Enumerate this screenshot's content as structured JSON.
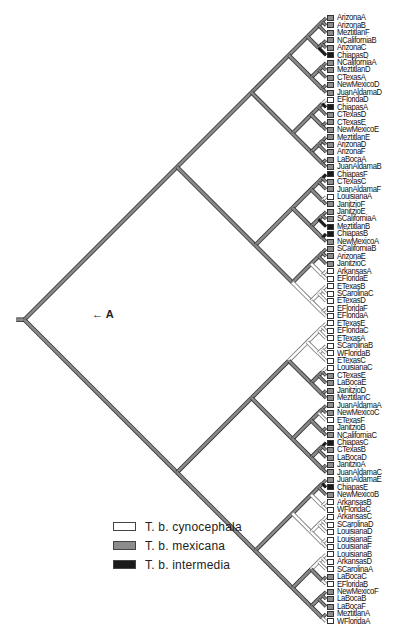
{
  "figure": {
    "annotation_label": "A",
    "annotation_arrow": "arrow-left"
  },
  "legend": [
    {
      "label": "T. b. cynocephala",
      "color": "#ffffff"
    },
    {
      "label": "T. b. mexicana",
      "color": "#8c8c8c"
    },
    {
      "label": "T. b. intermedia",
      "color": "#1a1a1a"
    }
  ],
  "colors": {
    "cynocephala": "#ffffff",
    "mexicana": "#8c8c8c",
    "intermedia": "#1a1a1a",
    "branch_stroke": "#555555"
  },
  "leaves": [
    {
      "name": "ArizonaA",
      "group": "mexicana"
    },
    {
      "name": "ArizonaB",
      "group": "mexicana"
    },
    {
      "name": "MeztitlanF",
      "group": "mexicana"
    },
    {
      "name": "NCaliforniaB",
      "group": "mexicana"
    },
    {
      "name": "ArizonaC",
      "group": "mexicana"
    },
    {
      "name": "ChiapasD",
      "group": "intermedia"
    },
    {
      "name": "NCaliforniaA",
      "group": "mexicana"
    },
    {
      "name": "MeztitlanD",
      "group": "mexicana"
    },
    {
      "name": "CTexasA",
      "group": "mexicana"
    },
    {
      "name": "NewMexicoD",
      "group": "mexicana"
    },
    {
      "name": "JuanAldamaD",
      "group": "mexicana"
    },
    {
      "name": "EFloridaD",
      "group": "cynocephala"
    },
    {
      "name": "ChiapasA",
      "group": "intermedia"
    },
    {
      "name": "CTexasD",
      "group": "mexicana"
    },
    {
      "name": "CTexasE",
      "group": "mexicana"
    },
    {
      "name": "NewMexicoE",
      "group": "mexicana"
    },
    {
      "name": "MeztitlanE",
      "group": "mexicana"
    },
    {
      "name": "ArizonaD",
      "group": "mexicana"
    },
    {
      "name": "ArizonaF",
      "group": "mexicana"
    },
    {
      "name": "LaBocaA",
      "group": "mexicana"
    },
    {
      "name": "JuanAldamaB",
      "group": "mexicana"
    },
    {
      "name": "ChiapasF",
      "group": "intermedia"
    },
    {
      "name": "CTexasC",
      "group": "mexicana"
    },
    {
      "name": "JuanAldamaF",
      "group": "mexicana"
    },
    {
      "name": "LouisianaA",
      "group": "cynocephala"
    },
    {
      "name": "JanitzioF",
      "group": "mexicana"
    },
    {
      "name": "JanitzioE",
      "group": "mexicana"
    },
    {
      "name": "SCaliforniaA",
      "group": "mexicana"
    },
    {
      "name": "MeztitlanB",
      "group": "intermedia"
    },
    {
      "name": "ChiapasB",
      "group": "intermedia"
    },
    {
      "name": "NewMexicoA",
      "group": "mexicana"
    },
    {
      "name": "SCaliforniaB",
      "group": "mexicana"
    },
    {
      "name": "ArizonaE",
      "group": "mexicana"
    },
    {
      "name": "JanitzioC",
      "group": "mexicana"
    },
    {
      "name": "ArkansasA",
      "group": "cynocephala"
    },
    {
      "name": "EFloridaE",
      "group": "cynocephala"
    },
    {
      "name": "ETexasB",
      "group": "cynocephala"
    },
    {
      "name": "SCarolinaC",
      "group": "cynocephala"
    },
    {
      "name": "ETexasD",
      "group": "cynocephala"
    },
    {
      "name": "EFloridaF",
      "group": "cynocephala"
    },
    {
      "name": "EFloridaA",
      "group": "cynocephala"
    },
    {
      "name": "ETexasE",
      "group": "cynocephala"
    },
    {
      "name": "EFloridaC",
      "group": "cynocephala"
    },
    {
      "name": "ETexasA",
      "group": "cynocephala"
    },
    {
      "name": "SCarolinaB",
      "group": "cynocephala"
    },
    {
      "name": "WFloridaB",
      "group": "cynocephala"
    },
    {
      "name": "ETexasC",
      "group": "cynocephala"
    },
    {
      "name": "LouisianaC",
      "group": "cynocephala"
    },
    {
      "name": "CTexasE",
      "group": "mexicana"
    },
    {
      "name": "LaBocaE",
      "group": "mexicana"
    },
    {
      "name": "JanitzioD",
      "group": "mexicana"
    },
    {
      "name": "MeztitlanC",
      "group": "mexicana"
    },
    {
      "name": "JuanAldamaA",
      "group": "mexicana"
    },
    {
      "name": "NewMexicoC",
      "group": "mexicana"
    },
    {
      "name": "ETexasF",
      "group": "cynocephala"
    },
    {
      "name": "JanitzioB",
      "group": "mexicana"
    },
    {
      "name": "NCaliforniaC",
      "group": "mexicana"
    },
    {
      "name": "ChiapasC",
      "group": "intermedia"
    },
    {
      "name": "CTexasB",
      "group": "mexicana"
    },
    {
      "name": "LaBocaD",
      "group": "mexicana"
    },
    {
      "name": "JanitzioA",
      "group": "mexicana"
    },
    {
      "name": "JuanAldamaC",
      "group": "mexicana"
    },
    {
      "name": "JuanAldamaE",
      "group": "mexicana"
    },
    {
      "name": "ChiapasE",
      "group": "intermedia"
    },
    {
      "name": "NewMexicoB",
      "group": "mexicana"
    },
    {
      "name": "ArkansasB",
      "group": "cynocephala"
    },
    {
      "name": "WFloridaC",
      "group": "cynocephala"
    },
    {
      "name": "ArkansasC",
      "group": "cynocephala"
    },
    {
      "name": "SCarolinaD",
      "group": "cynocephala"
    },
    {
      "name": "LouisianaD",
      "group": "cynocephala"
    },
    {
      "name": "LouisianaE",
      "group": "cynocephala"
    },
    {
      "name": "LouisianaF",
      "group": "cynocephala"
    },
    {
      "name": "LouisianaB",
      "group": "cynocephala"
    },
    {
      "name": "ArkansasD",
      "group": "cynocephala"
    },
    {
      "name": "SCarolinaA",
      "group": "cynocephala"
    },
    {
      "name": "LaBocaC",
      "group": "mexicana"
    },
    {
      "name": "EFloridaB",
      "group": "cynocephala"
    },
    {
      "name": "NewMexicoF",
      "group": "mexicana"
    },
    {
      "name": "LaBocaB",
      "group": "mexicana"
    },
    {
      "name": "LaBocaF",
      "group": "mexicana"
    },
    {
      "name": "MeztitlanA",
      "group": "mexicana"
    },
    {
      "name": "WFloridaA",
      "group": "cynocephala"
    }
  ]
}
